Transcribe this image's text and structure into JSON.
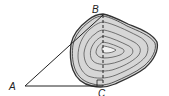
{
  "diagram": {
    "type": "geometry-contour",
    "points": [
      {
        "id": "A",
        "label": "A",
        "x": 25,
        "y": 86
      },
      {
        "id": "B",
        "label": "B",
        "x": 103,
        "y": 15
      },
      {
        "id": "C",
        "label": "C",
        "x": 103,
        "y": 86
      }
    ],
    "segments": [
      {
        "from": "A",
        "to": "B",
        "style": "solid"
      },
      {
        "from": "A",
        "to": "C",
        "style": "solid"
      },
      {
        "from": "B",
        "to": "C",
        "style": "dashed"
      }
    ],
    "right_angle_at": "C",
    "region": {
      "description": "irregular lake-shaped region with concentric contour lines",
      "fill": "#d6d6d6",
      "stroke": "#333333",
      "contour_count": 6
    }
  }
}
